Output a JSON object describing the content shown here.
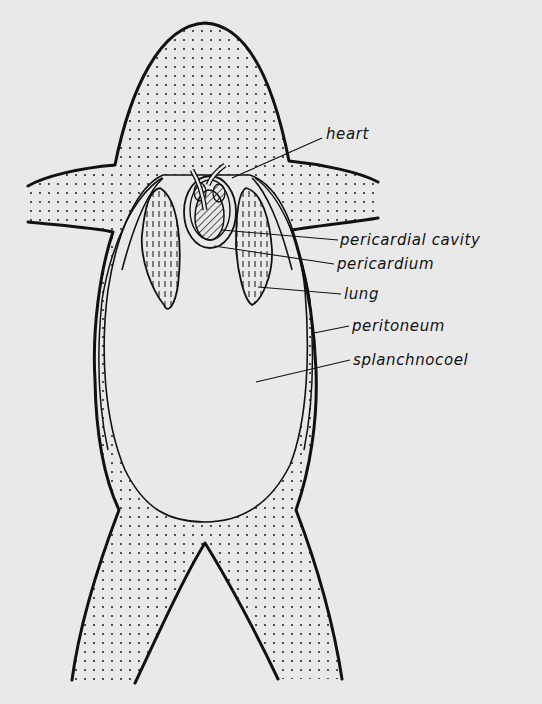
{
  "figure": {
    "labels": [
      {
        "id": "heart",
        "text": "heart",
        "x": 326,
        "y": 127
      },
      {
        "id": "pericardial-cavity",
        "text": "pericardial cavity",
        "x": 340,
        "y": 233
      },
      {
        "id": "pericardium",
        "text": "pericardium",
        "x": 337,
        "y": 257
      },
      {
        "id": "lung",
        "text": "lung",
        "x": 344,
        "y": 287
      },
      {
        "id": "peritoneum",
        "text": "peritoneum",
        "x": 352,
        "y": 319
      },
      {
        "id": "splanchnocoel",
        "text": "splanchnocoel",
        "x": 353,
        "y": 353
      }
    ],
    "caption_visible": false,
    "colors": {
      "paper": "#e9e9e9",
      "ink": "#111111",
      "stipple": "#2a2a2a"
    }
  }
}
